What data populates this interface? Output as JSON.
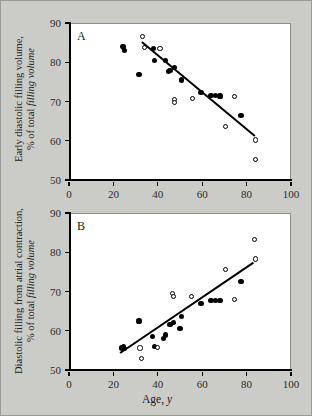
{
  "figure": {
    "background_color": "#cbcbc8",
    "plot_background_color": "#ffffff",
    "axis_color": "#000000"
  },
  "axes": {
    "x_ticks": [
      "0",
      "20",
      "40",
      "60",
      "80",
      "100"
    ],
    "x_tick_values": [
      0,
      20,
      40,
      60,
      80,
      100
    ],
    "y_ticks": [
      "50",
      "60",
      "70",
      "80",
      "90"
    ],
    "y_tick_values": [
      50,
      60,
      70,
      80,
      90
    ],
    "xlabel_main": "Age, ",
    "xlabel_italic": "y",
    "xlim": [
      0,
      100
    ],
    "ylim": [
      50,
      90
    ]
  },
  "panel_a": {
    "letter": "A",
    "ylabel_line1": "Early diastolic filling volume,",
    "ylabel_line2_prefix": "% of total ",
    "ylabel_line2_italic": "filling volume"
  },
  "panel_b": {
    "letter": "B",
    "ylabel_line1": "Diastolic filling from atrial contraction,",
    "ylabel_line2_prefix": "% of total ",
    "ylabel_line2_italic": "filling volume"
  },
  "chart_data": [
    {
      "type": "scatter",
      "panel": "A",
      "title": "",
      "xlabel": "Age, y",
      "ylabel": "Early diastolic filling volume, % of total filling volume",
      "xlim": [
        0,
        100
      ],
      "ylim": [
        50,
        90
      ],
      "xticks": [
        0,
        20,
        40,
        60,
        80,
        100
      ],
      "yticks": [
        50,
        60,
        70,
        80,
        90
      ],
      "grid": false,
      "legend": "none",
      "series": [
        {
          "name": "filled-circles",
          "marker": "filled circle",
          "points": [
            [
              24.0,
              84.0
            ],
            [
              24.5,
              83.9
            ],
            [
              25.0,
              83.0
            ],
            [
              31.5,
              76.9
            ],
            [
              38.0,
              83.6
            ],
            [
              38.5,
              80.4
            ],
            [
              43.5,
              80.4
            ],
            [
              45.0,
              77.6
            ],
            [
              45.5,
              78.0
            ],
            [
              47.5,
              78.7
            ],
            [
              50.5,
              75.5
            ],
            [
              59.5,
              72.2
            ],
            [
              64.0,
              71.5
            ],
            [
              66.0,
              71.5
            ],
            [
              68.0,
              71.4
            ],
            [
              77.5,
              66.4
            ]
          ]
        },
        {
          "name": "open-circles",
          "marker": "open circle",
          "points": [
            [
              33.0,
              86.6
            ],
            [
              34.0,
              83.8
            ],
            [
              41.0,
              83.6
            ],
            [
              47.5,
              70.6
            ],
            [
              47.5,
              69.8
            ],
            [
              55.5,
              70.7
            ],
            [
              70.5,
              63.6
            ],
            [
              74.5,
              71.2
            ],
            [
              84.0,
              60.2
            ],
            [
              84.0,
              55.3
            ]
          ]
        }
      ],
      "regression_line": {
        "x1": 33.0,
        "y1": 85.2,
        "x2": 84.0,
        "y2": 61.2
      }
    },
    {
      "type": "scatter",
      "panel": "B",
      "title": "",
      "xlabel": "Age, y",
      "ylabel": "Diastolic filling from atrial contraction, % of total filling volume",
      "xlim": [
        0,
        100
      ],
      "ylim": [
        50,
        90
      ],
      "xticks": [
        0,
        20,
        40,
        60,
        80,
        100
      ],
      "yticks": [
        50,
        60,
        70,
        80,
        90
      ],
      "grid": false,
      "legend": "none",
      "series": [
        {
          "name": "filled-circles",
          "marker": "filled circle",
          "points": [
            [
              23.5,
              55.6
            ],
            [
              24.5,
              56.0
            ],
            [
              25.0,
              55.4
            ],
            [
              31.5,
              62.5
            ],
            [
              37.5,
              58.6
            ],
            [
              38.5,
              56.0
            ],
            [
              42.5,
              58.0
            ],
            [
              43.5,
              58.9
            ],
            [
              45.5,
              61.6
            ],
            [
              47.0,
              62.0
            ],
            [
              50.0,
              60.5
            ],
            [
              50.5,
              63.6
            ],
            [
              59.5,
              67.0
            ],
            [
              64.0,
              67.7
            ],
            [
              66.0,
              67.7
            ],
            [
              68.0,
              67.7
            ],
            [
              77.5,
              72.5
            ]
          ]
        },
        {
          "name": "open-circles",
          "marker": "open circle",
          "points": [
            [
              32.0,
              55.6
            ],
            [
              32.5,
              52.9
            ],
            [
              40.0,
              55.8
            ],
            [
              46.5,
              69.5
            ],
            [
              47.0,
              68.8
            ],
            [
              55.0,
              68.8
            ],
            [
              70.5,
              75.6
            ],
            [
              74.5,
              67.9
            ],
            [
              83.5,
              83.3
            ],
            [
              84.0,
              78.3
            ]
          ]
        }
      ],
      "regression_line": {
        "x1": 23.0,
        "y1": 54.5,
        "x2": 83.0,
        "y2": 77.5
      }
    }
  ]
}
